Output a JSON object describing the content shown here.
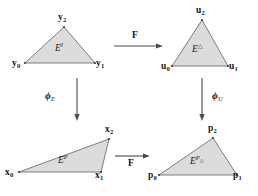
{
  "figure": {
    "type": "commutative-diagram",
    "title": "",
    "background_color": "#ffffff",
    "triangle_fill": "#dcdcdc",
    "triangle_stroke": "#6f6f6f",
    "arrow_color": "#4a4a4a"
  },
  "panels": {
    "top_left": {
      "name": "ideal-element",
      "element_label": {
        "base": "E",
        "superscript": "I"
      },
      "vertices": [
        {
          "name": "y0",
          "base": "y",
          "subscript": "0"
        },
        {
          "name": "y1",
          "base": "y",
          "subscript": "1"
        },
        {
          "name": "y2",
          "base": "y",
          "subscript": "2"
        }
      ]
    },
    "top_right": {
      "name": "reference-element",
      "element_label": {
        "base": "E",
        "superscript": "△"
      },
      "vertices": [
        {
          "name": "u0",
          "base": "u",
          "subscript": "0"
        },
        {
          "name": "u1",
          "base": "u",
          "subscript": "1"
        },
        {
          "name": "u2",
          "base": "u",
          "subscript": "2"
        }
      ]
    },
    "bottom_left": {
      "name": "physical-element",
      "element_label": {
        "base": "E",
        "superscript": "P"
      },
      "vertices": [
        {
          "name": "x0",
          "base": "x",
          "subscript": "0"
        },
        {
          "name": "x1",
          "base": "x",
          "subscript": "1"
        },
        {
          "name": "x2",
          "base": "x",
          "subscript": "2"
        }
      ]
    },
    "bottom_right": {
      "name": "physical-reference-element",
      "element_label": {
        "base": "E",
        "superscript": "P",
        "superscript_sub": "△"
      },
      "vertices": [
        {
          "name": "p0",
          "base": "p",
          "subscript": "0"
        },
        {
          "name": "p1",
          "base": "p",
          "subscript": "1"
        },
        {
          "name": "p2",
          "base": "p",
          "subscript": "2"
        }
      ]
    }
  },
  "maps": {
    "top_horizontal": {
      "name": "map-F-top",
      "label": "F",
      "direction": "right"
    },
    "bottom_horizontal": {
      "name": "map-F-bottom",
      "label": "F",
      "direction": "right"
    },
    "left_vertical": {
      "name": "map-phi-E",
      "base": "ϕ",
      "subscript": "E",
      "direction": "down"
    },
    "right_vertical": {
      "name": "map-phi-U",
      "base": "ϕ",
      "subscript": "U",
      "direction": "down"
    }
  }
}
